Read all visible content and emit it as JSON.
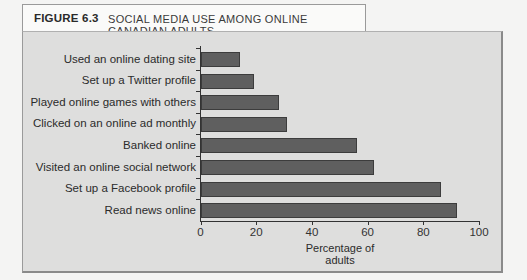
{
  "figure": {
    "number_label": "FIGURE 6.3",
    "title": "SOCIAL MEDIA USE AMONG ONLINE CANADIAN ADULTS"
  },
  "colors": {
    "bar_fill": "#5f5f5f",
    "bar_border": "#3c3c3c",
    "panel_bg": "#dededd",
    "page_bg": "#f4f4f3"
  },
  "chart_data": {
    "type": "bar",
    "orientation": "horizontal",
    "title": "SOCIAL MEDIA USE AMONG ONLINE CANADIAN ADULTS",
    "categories": [
      "Used an online dating site",
      "Set up a Twitter profile",
      "Played online games with others",
      "Clicked on an online ad monthly",
      "Banked online",
      "Visited an online social network",
      "Set up a Facebook profile",
      "Read news online"
    ],
    "values": [
      14,
      19,
      28,
      31,
      56,
      62,
      86,
      92
    ],
    "xlabel": "Percentage of adults",
    "ylabel": "",
    "xlim": [
      0,
      100
    ],
    "xticks": [
      "0",
      "20",
      "40",
      "60",
      "80",
      "100"
    ],
    "grid": false,
    "legend": null
  }
}
